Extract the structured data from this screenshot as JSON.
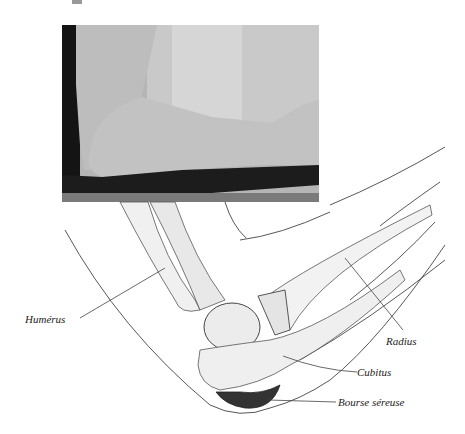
{
  "figure": {
    "photo": {
      "description": "Photograph of a bent elbow with swelling at the olecranon"
    },
    "illustration": {
      "description": "Anatomical line drawing of the elbow joint in flexion"
    },
    "labels": [
      {
        "id": "humerus",
        "text": "Humérus"
      },
      {
        "id": "radius",
        "text": "Radius"
      },
      {
        "id": "cubitus",
        "text": "Cubitus"
      },
      {
        "id": "bourse",
        "text": "Bourse séreuse"
      }
    ],
    "colors": {
      "line": "#444444",
      "bursa": "#333333",
      "bone_fill": "#f2f2f2",
      "photo_dark": "#1a1a1a"
    }
  }
}
